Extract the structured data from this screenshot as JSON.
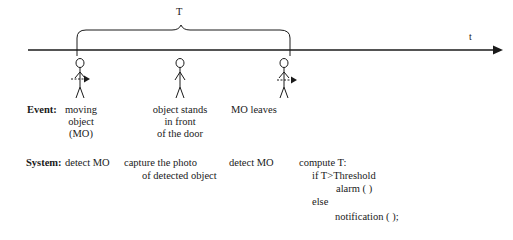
{
  "timeline": {
    "axis_label": "t",
    "interval_label": "T"
  },
  "events": {
    "heading": "Event:",
    "items": [
      {
        "lines": [
          "moving",
          "object",
          "(MO)"
        ]
      },
      {
        "lines": [
          "object stands",
          "in front",
          "of the door"
        ]
      },
      {
        "lines": [
          "MO leaves"
        ]
      }
    ]
  },
  "system": {
    "heading": "System:",
    "items": [
      {
        "lines": [
          "detect MO"
        ]
      },
      {
        "lines": [
          "capture the photo",
          "of detected object"
        ]
      },
      {
        "lines": [
          "detect MO"
        ]
      },
      {
        "lines": [
          "compute T:",
          "if T>Threshold",
          "alarm ( )",
          "else",
          "notification ( );"
        ]
      }
    ]
  },
  "colors": {
    "ink": "#1a1a1a",
    "background": "#ffffff"
  }
}
